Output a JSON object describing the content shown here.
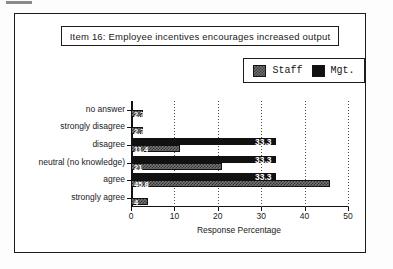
{
  "figure": {
    "title": "Item 16:  Employee incentives encourages increased output",
    "legend": [
      {
        "label": "Staff",
        "swatch": "gray-hatched-swatch",
        "color": "#757575"
      },
      {
        "label": "Mgt.",
        "swatch": "black-swatch",
        "color": "#111111"
      }
    ]
  },
  "axis": {
    "x_title": "Response Percentage",
    "x_ticks": [
      "0",
      "10",
      "20",
      "30",
      "40",
      "50"
    ]
  },
  "chart_data": {
    "type": "bar",
    "title": "Item 16:  Employee incentives encourages increased output",
    "xlabel": "Response Percentage",
    "ylabel": "",
    "orientation": "horizontal",
    "grid": true,
    "legend_position": "top-right",
    "xlim": [
      0,
      50
    ],
    "xticks": [
      0,
      10,
      20,
      30,
      40,
      50
    ],
    "categories": [
      "no answer",
      "strongly  disagree",
      "disagree",
      "neutral (no knowledge)",
      "agree",
      "strongly  agree"
    ],
    "series": [
      {
        "name": "Staff",
        "color": "#757575",
        "values": [
          2.7,
          2.7,
          11.4,
          21.0,
          45.8,
          4.0
        ],
        "labels": [
          "2.7",
          "2.7",
          "11.4",
          "21",
          "45.8",
          "4"
        ]
      },
      {
        "name": "Mgt.",
        "color": "#111111",
        "values": [
          0,
          0,
          33.3,
          33.3,
          33.3,
          0
        ],
        "labels": [
          "",
          "",
          "33.3",
          "33.3",
          "33.3",
          ""
        ]
      }
    ]
  }
}
